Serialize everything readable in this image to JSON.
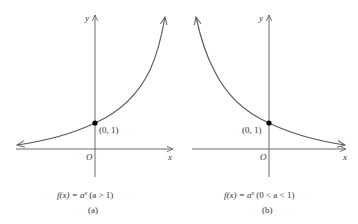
{
  "figure": {
    "panels": [
      {
        "id": "a",
        "axis_x_label": "x",
        "axis_y_label": "y",
        "origin_label": "O",
        "point_label": "(0, 1)",
        "caption_func_lhs": "f(x) = a",
        "caption_exp": "x",
        "caption_condition": "(a > 1)",
        "panel_label": "(a)",
        "curve": "increasing exponential"
      },
      {
        "id": "b",
        "axis_x_label": "x",
        "axis_y_label": "y",
        "origin_label": "O",
        "point_label": "(0, 1)",
        "caption_func_lhs": "f(x) = a",
        "caption_exp": "x",
        "caption_condition": "(0 < a < 1)",
        "panel_label": "(b)",
        "curve": "decreasing exponential"
      }
    ]
  },
  "colors": {
    "axis": "#6a6a6a",
    "curve": "#5e5e5e",
    "point": "#000000",
    "text": "#333333"
  }
}
